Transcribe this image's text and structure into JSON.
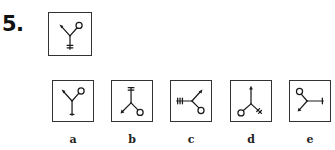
{
  "question": {
    "number": "5.",
    "prompt_figure": {
      "description": "Y-shaped figure: arrow at upper-left arm, circle at upper-right arm, cross-ticked stem pointing down",
      "arms": [
        {
          "end": "arrow",
          "direction": "up-left"
        },
        {
          "end": "circle",
          "direction": "up-right"
        },
        {
          "end": "ticks",
          "direction": "down"
        }
      ]
    }
  },
  "options": [
    {
      "label": "a",
      "arms": [
        {
          "end": "arrow",
          "direction": "up-left"
        },
        {
          "end": "circle",
          "direction": "up-right"
        },
        {
          "end": "single-tick",
          "direction": "down"
        }
      ]
    },
    {
      "label": "b",
      "arms": [
        {
          "end": "ticks",
          "direction": "up"
        },
        {
          "end": "arrow",
          "direction": "down-left"
        },
        {
          "end": "circle",
          "direction": "down-right"
        }
      ]
    },
    {
      "label": "c",
      "arms": [
        {
          "end": "ticks",
          "direction": "left"
        },
        {
          "end": "arrow",
          "direction": "up-right"
        },
        {
          "end": "circle",
          "direction": "down-right"
        }
      ]
    },
    {
      "label": "d",
      "arms": [
        {
          "end": "arrow",
          "direction": "up"
        },
        {
          "end": "circle",
          "direction": "down-left"
        },
        {
          "end": "ticks",
          "direction": "down-right"
        }
      ]
    },
    {
      "label": "e",
      "arms": [
        {
          "end": "circle",
          "direction": "up-left"
        },
        {
          "end": "arrow",
          "direction": "down-left"
        },
        {
          "end": "single-tick",
          "direction": "right"
        }
      ]
    }
  ],
  "colors": {
    "ink": "#1a1a1a",
    "border": "#333333",
    "background": "#ffffff"
  }
}
